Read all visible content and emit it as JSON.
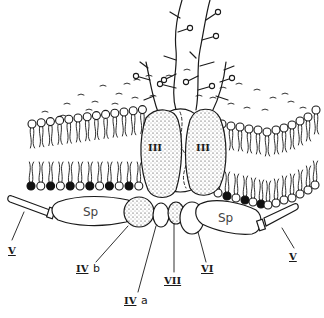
{
  "diagram": {
    "labels": {
      "glycophorin": "GP",
      "band3_left": "III",
      "band3_right": "III",
      "spectrin_left": "Sp",
      "spectrin_right": "Sp",
      "band5_left": "V",
      "band5_right": "V",
      "band4_1b": "IV b",
      "band4_1a": "IV a",
      "band7": "VII",
      "band6": "VI"
    },
    "label_parts": {
      "IVb_roman": "IV",
      "IVb_suffix": "b",
      "IVa_roman": "IV",
      "IVa_suffix": "a"
    },
    "colors": {
      "ink": "#1a1a1a",
      "background": "#ffffff",
      "filled_head": "#111111"
    }
  }
}
